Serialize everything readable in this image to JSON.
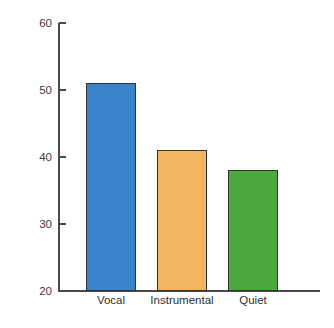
{
  "chart_data": {
    "type": "bar",
    "title": "",
    "xlabel": "",
    "ylabel": "Percent Errors",
    "categories": [
      "Vocal",
      "Instrumental",
      "Quiet"
    ],
    "values": [
      51,
      41,
      38
    ],
    "colors": [
      "#3b83c8",
      "#f5b461",
      "#4aa93f"
    ],
    "ylim": [
      20,
      60
    ],
    "yticks": [
      20,
      30,
      40,
      50,
      60
    ],
    "ytick_labels": [
      "20",
      "30",
      "40",
      "50",
      "60"
    ],
    "grid": false,
    "legend": null,
    "bar_border_color": "#333333",
    "axis_color": "#4a4a4a",
    "text_color": "#3a3a3a"
  },
  "axis": {
    "y_title": "Percent Errors"
  }
}
